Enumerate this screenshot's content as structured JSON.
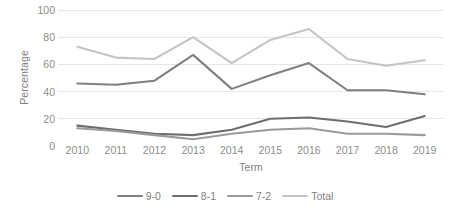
{
  "chart_data": {
    "type": "line",
    "title": "",
    "xlabel": "Term",
    "ylabel": "Percentage",
    "x": [
      2010,
      2011,
      2012,
      2013,
      2014,
      2015,
      2016,
      2017,
      2018,
      2019
    ],
    "categories": [
      "2010",
      "2011",
      "2012",
      "2013",
      "2014",
      "2015",
      "2016",
      "2017",
      "2018",
      "2019"
    ],
    "ylim": [
      0,
      100
    ],
    "yticks": [
      0,
      20,
      40,
      60,
      80,
      100
    ],
    "ytick_labels": [
      "0",
      "20",
      "40",
      "60",
      "80",
      "100"
    ],
    "grid": true,
    "grid_axis": "y",
    "legend_position": "bottom",
    "series": [
      {
        "name": "9-0",
        "color": "#808080",
        "values": [
          46,
          45,
          48,
          67,
          42,
          52,
          61,
          41,
          41,
          38
        ]
      },
      {
        "name": "8-1",
        "color": "#6e6e6e",
        "values": [
          15,
          12,
          9,
          8,
          12,
          20,
          21,
          18,
          14,
          22
        ]
      },
      {
        "name": "7-2",
        "color": "#9a9a9a",
        "values": [
          13,
          11,
          8,
          5,
          9,
          12,
          13,
          9,
          9,
          8
        ]
      },
      {
        "name": "Total",
        "color": "#c4c4c4",
        "values": [
          73,
          65,
          64,
          80,
          61,
          78,
          86,
          64,
          59,
          63
        ]
      }
    ]
  }
}
